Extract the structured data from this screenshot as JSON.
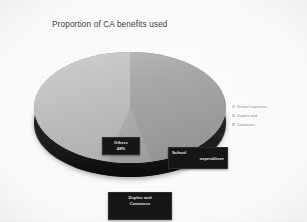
{
  "chart_data": {
    "type": "pie",
    "title": "Proportion of CA benefits used",
    "categories": [
      "Others",
      "School expenditure",
      "Duplex and Commons"
    ],
    "values": [
      48,
      37,
      15
    ],
    "value_unit": "%",
    "data_labels": [
      {
        "line1": "Others",
        "line2": "48%"
      },
      {
        "line1": "School",
        "line2": "expenditure"
      },
      {
        "line1": "Duplex and",
        "line2": "Commons"
      }
    ],
    "legend": {
      "position": "right",
      "entries": [
        {
          "label": "School expenses",
          "color": "#d6d6d6"
        },
        {
          "label": "Duplex and",
          "color": "#d0d0d0"
        },
        {
          "label": "Commons",
          "color": "#cccccc"
        }
      ]
    },
    "grid": false,
    "style": "3d-pie",
    "colors": {
      "others": "#bcbcbc",
      "school": "#a3a3a3",
      "duplex": "#adadad",
      "rim": "#151515",
      "background": "#f6f6f5",
      "title_color": "#3b3b3b",
      "label_bg": "#161616",
      "label_text": "#e8e8e8"
    }
  }
}
